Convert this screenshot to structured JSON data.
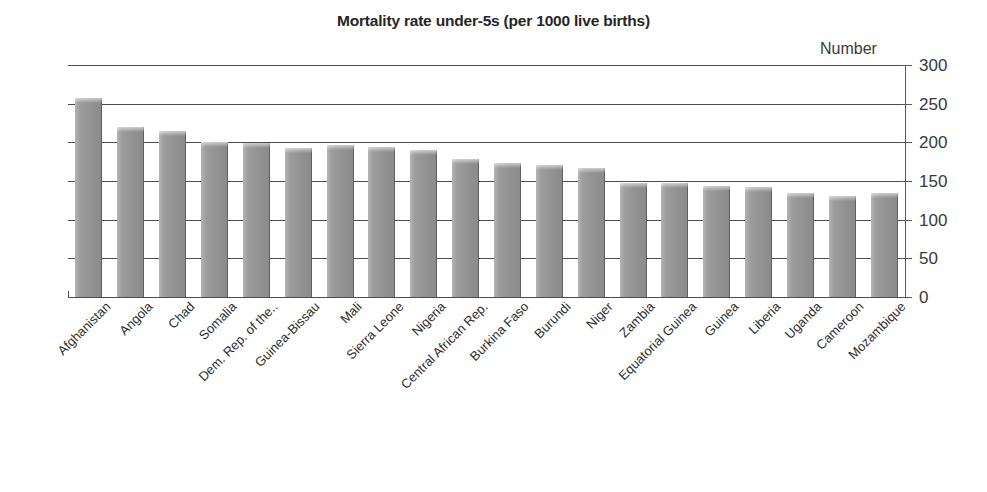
{
  "chart_data": {
    "type": "bar",
    "title": "Mortality rate under-5s (per 1000 live births)",
    "xlabel": "",
    "ylabel": "Number",
    "ylim": [
      0,
      300
    ],
    "yticks": [
      0,
      50,
      100,
      150,
      200,
      250,
      300
    ],
    "grid": true,
    "legend": null,
    "orientation": "vertical",
    "bar_color": "#949494",
    "categories": [
      "Afghanistan",
      "Angola",
      "Chad",
      "Somalia",
      "Dem. Rep. of the..",
      "Guinea-Bissau",
      "Mali",
      "Sierra Leone",
      "Nigeria",
      "Central African Rep.",
      "Burkina Faso",
      "Burundi",
      "Niger",
      "Zambia",
      "Equatorial Guinea",
      "Guinea",
      "Liberia",
      "Uganda",
      "Cameroon",
      "Mozambique"
    ],
    "values": [
      257,
      220,
      215,
      200,
      199,
      193,
      196,
      194,
      190,
      178,
      173,
      171,
      167,
      148,
      147,
      143,
      142,
      135,
      131,
      135
    ]
  },
  "axis": {
    "unit_label": "Number",
    "tick_labels": [
      "300",
      "250",
      "200",
      "150",
      "100",
      "50",
      "0"
    ]
  }
}
